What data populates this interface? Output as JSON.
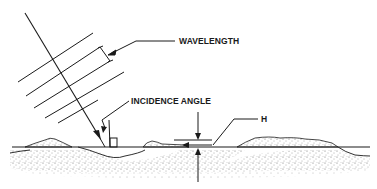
{
  "diagram": {
    "type": "radar-incidence-wave-diagram",
    "labels": {
      "wavelength": "WAVELENGTH",
      "incidence_angle": "INCIDENCE ANGLE",
      "height": "H"
    },
    "elements": [
      "incident-ray",
      "wavefront-lines",
      "wavelength-bracket",
      "incidence-angle-marker",
      "right-angle-box",
      "ground-surface-line",
      "terrain-mounds",
      "height-indicator",
      "stippled-ground"
    ],
    "colors": {
      "line": "#1a1a1a",
      "background": "#ffffff",
      "stipple": "#555555"
    }
  }
}
